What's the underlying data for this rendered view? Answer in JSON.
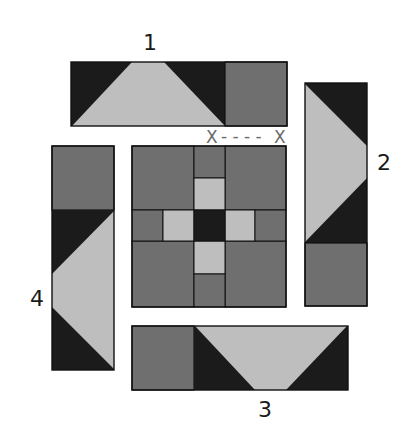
{
  "colors": {
    "dark": "#1b1b1b",
    "medium": "#6f6f6f",
    "light": "#bebebe",
    "outline": "#111111",
    "marker": "#6a6a6a"
  },
  "labels": {
    "strip1": "1",
    "strip2": "2",
    "strip3": "3",
    "strip4": "4"
  },
  "marker": {
    "left": "X",
    "dashes": "- - - -",
    "right": "X"
  },
  "center_block": {
    "rows": [
      [
        "medium",
        "medium",
        "medium"
      ],
      [
        "medium-light",
        "dark",
        "light-medium"
      ],
      [
        "medium",
        "medium",
        "medium"
      ]
    ],
    "description": "Nine-patch center with dark center square, light cross arms and medium corners"
  },
  "strips": [
    {
      "id": "1",
      "position": "top",
      "pieces": [
        "flying-geese (light on dark)",
        "medium square"
      ]
    },
    {
      "id": "2",
      "position": "right",
      "pieces": [
        "flying-geese (light on dark, pointing right)",
        "medium square"
      ]
    },
    {
      "id": "3",
      "position": "bottom",
      "pieces": [
        "medium square",
        "flying-geese (light on dark, pointing down)"
      ]
    },
    {
      "id": "4",
      "position": "left",
      "pieces": [
        "medium square",
        "flying-geese (light on dark, pointing left)"
      ]
    }
  ]
}
